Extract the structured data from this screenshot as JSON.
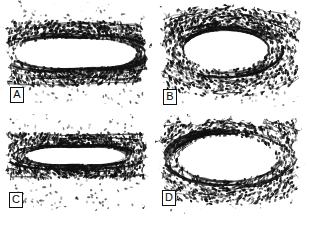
{
  "figure": {
    "kind": "histology-micrograph-figure",
    "layout": "2x2 grid",
    "background_color": "#ffffff",
    "ink_color": "#101010",
    "panel_count": 4
  },
  "panels": [
    {
      "id": "A",
      "label": "A",
      "position": "top-left",
      "label_position": "bottom-left",
      "lumen_shape": "wide-lenticular",
      "lumen_cx": 0.52,
      "lumen_cy": 0.48,
      "lumen_rx": 0.31,
      "lumen_ry": 0.16,
      "wall_thickness": 0.2,
      "density": 1.0,
      "seed": 11
    },
    {
      "id": "B",
      "label": "B",
      "position": "top-right",
      "label_position": "bottom-left",
      "lumen_shape": "broad-oval",
      "lumen_cx": 0.47,
      "lumen_cy": 0.44,
      "lumen_rx": 0.25,
      "lumen_ry": 0.18,
      "wall_thickness": 0.22,
      "density": 0.86,
      "seed": 29
    },
    {
      "id": "C",
      "label": "C",
      "position": "bottom-left",
      "label_position": "bottom-left",
      "lumen_shape": "narrow-slit",
      "lumen_cx": 0.5,
      "lumen_cy": 0.42,
      "lumen_rx": 0.24,
      "lumen_ry": 0.11,
      "wall_thickness": 0.28,
      "density": 0.92,
      "seed": 47
    },
    {
      "id": "D",
      "label": "D",
      "position": "bottom-right",
      "label_position": "bottom-left",
      "lumen_shape": "large-oval",
      "lumen_cx": 0.48,
      "lumen_cy": 0.44,
      "lumen_rx": 0.3,
      "lumen_ry": 0.22,
      "wall_thickness": 0.19,
      "density": 0.78,
      "seed": 73
    }
  ]
}
